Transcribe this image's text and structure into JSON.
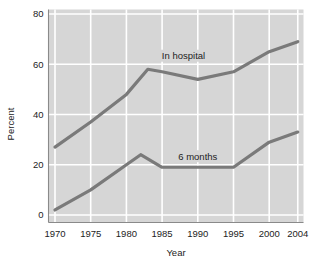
{
  "chart_data": {
    "type": "line",
    "title": "",
    "subtitle": "",
    "xlabel": "Year",
    "ylabel": "Percent",
    "xlim": [
      1970,
      2004
    ],
    "ylim": [
      0,
      80
    ],
    "grid": true,
    "grid_color": "#ffffff",
    "plot_background": "#d6d6d6",
    "line_color": "#7a7a7a",
    "legend_position": "inline-annotation",
    "ytick_labels": [
      "0",
      "20",
      "40",
      "60",
      "80"
    ],
    "ytick_values": [
      0,
      20,
      40,
      60,
      80
    ],
    "xtick_labels": [
      "1970",
      "1975",
      "1980",
      "1985",
      "1990",
      "1995",
      "2000",
      "2004"
    ],
    "xtick_values": [
      1970,
      1975,
      1980,
      1985,
      1990,
      1995,
      2000,
      2004
    ],
    "series": [
      {
        "name": "In hospital",
        "label_x": 1988,
        "label_y": 63,
        "x": [
          1970,
          1975,
          1980,
          1983,
          1985,
          1990,
          1995,
          2000,
          2004
        ],
        "values": [
          27,
          37,
          48,
          58,
          57,
          54,
          57,
          65,
          69
        ]
      },
      {
        "name": "6 months",
        "label_x": 1990,
        "label_y": 23,
        "x": [
          1970,
          1975,
          1980,
          1982,
          1985,
          1990,
          1995,
          2000,
          2004
        ],
        "values": [
          2,
          10,
          20,
          24,
          19,
          19,
          19,
          29,
          33
        ]
      }
    ],
    "annotations": [
      {
        "text": "In hospital",
        "x": 1988,
        "y": 63
      },
      {
        "text": "6 months",
        "x": 1990,
        "y": 23
      }
    ]
  }
}
